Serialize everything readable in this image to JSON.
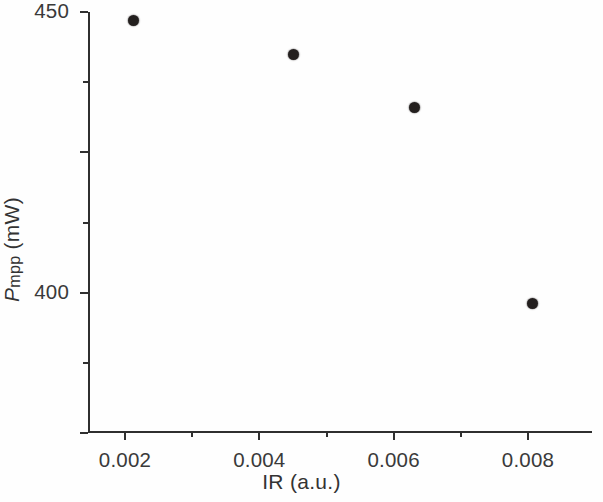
{
  "chart_data": {
    "type": "scatter",
    "title": "",
    "subtitle": "",
    "xlabel": "IR (a.u.)",
    "ylabel": "Pmpp (mW)",
    "ylabel_parts": {
      "symbol": "P",
      "subscript": "mpp",
      "unit": " (mW)"
    },
    "xlim": [
      0.0013,
      0.0088
    ],
    "ylim": [
      300,
      450
    ],
    "grid": false,
    "legend": null,
    "x_ticks_major": [
      0.002,
      0.004,
      0.006,
      0.008
    ],
    "x_tick_labels": [
      "0.002",
      "0.004",
      "0.006",
      "0.008"
    ],
    "x_ticks_minor": [
      0.003,
      0.005,
      0.007
    ],
    "y_ticks_major": [
      300,
      350,
      400,
      450
    ],
    "y_tick_labels": [
      "300",
      "350",
      "400",
      "450"
    ],
    "y_ticks_minor": [
      325,
      375,
      425
    ],
    "series": [
      {
        "name": "Pmpp vs IR",
        "marker": "filled-circle",
        "color": "#231f1e",
        "points": [
          {
            "x": 0.00213,
            "y": 447
          },
          {
            "x": 0.00451,
            "y": 435
          },
          {
            "x": 0.00631,
            "y": 416
          },
          {
            "x": 0.00807,
            "y": 346
          }
        ]
      }
    ],
    "x": [
      0.00213,
      0.00451,
      0.00631,
      0.00807
    ],
    "values": [
      447,
      435,
      416,
      346
    ]
  },
  "figure": {
    "background_color": "#ffffff",
    "axis_color": "#2f2f2f",
    "text_color": "#333333",
    "marker_color": "#231f1e"
  }
}
